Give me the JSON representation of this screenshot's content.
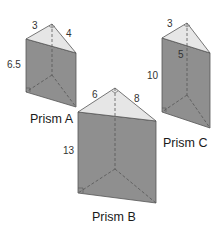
{
  "colors": {
    "background": "#ffffff",
    "top_face": "#e6e6e6",
    "side_face": "#8f8f8f",
    "edge": "#555555",
    "hidden_edge": "#555555",
    "text": "#333333"
  },
  "prisms": [
    {
      "id": "A",
      "name": "Prism A",
      "base_leg_1": "3",
      "base_leg_2": "4",
      "height": "6.5"
    },
    {
      "id": "B",
      "name": "Prism B",
      "base_leg_1": "6",
      "base_leg_2": "8",
      "height": "13"
    },
    {
      "id": "C",
      "name": "Prism C",
      "base_leg_1": "3",
      "base_leg_2": "5",
      "height": "10"
    }
  ]
}
